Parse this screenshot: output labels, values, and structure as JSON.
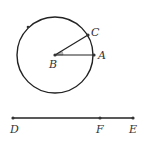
{
  "figure": {
    "colors": {
      "stroke": "#222222",
      "point": "#333333",
      "angle_fill": "#bbbbbb",
      "label": "#333333",
      "background": "#ffffff"
    },
    "circle": {
      "center_label": "B",
      "cx": 55,
      "cy": 55,
      "r": 38,
      "extra_point": {
        "x": 28,
        "y": 27
      }
    },
    "points": {
      "A": {
        "label": "A",
        "x": 94,
        "y": 55
      },
      "B": {
        "label": "B",
        "x": 55,
        "y": 55
      },
      "C": {
        "label": "C",
        "x": 88,
        "y": 35
      },
      "D": {
        "label": "D",
        "x": 13,
        "y": 118
      },
      "E": {
        "label": "E",
        "x": 133,
        "y": 118
      },
      "F": {
        "label": "F",
        "x": 100,
        "y": 118
      }
    },
    "segments": [
      "BA",
      "BC",
      "DE"
    ],
    "angle": {
      "vertex": "B",
      "from": "A",
      "to": "C",
      "marked": true
    }
  }
}
